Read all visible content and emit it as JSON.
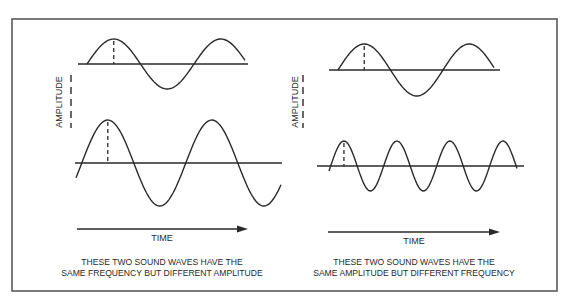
{
  "figure": {
    "frame": {
      "x": 12,
      "y": 19,
      "width": 545,
      "height": 272,
      "stroke": "#5a5a5a"
    },
    "ink_color": "#2a2a2a",
    "panels": [
      {
        "id": "left",
        "amplitude_label": "AMPLITUDE",
        "time_label": "TIME",
        "caption_line1": "THESE TWO SOUND WAVES HAVE THE",
        "caption_line2": "SAME FREQUENCY BUT DIFFERENT AMPLITUDE",
        "waves": [
          {
            "name": "top-left-wave",
            "axis_x1": 78,
            "axis_x2": 248,
            "baseline_y": 64,
            "start_x": 87,
            "end_x": 245,
            "amplitude": 25,
            "period": 107,
            "phase_start": 0,
            "peak_marker_x": 113
          },
          {
            "name": "bottom-left-wave",
            "axis_x1": 75,
            "axis_x2": 282,
            "baseline_y": 163,
            "start_x": 76,
            "end_x": 281,
            "amplitude": 43,
            "period": 104,
            "phase_start": -0.35,
            "peak_marker_x": 102
          }
        ],
        "amp_label_x": 59,
        "amp_label_y": 102,
        "amp_dash_x": 71,
        "amp_dash_y1": 75,
        "amp_dash_y2": 128,
        "arrow": {
          "x1": 77,
          "x2": 248,
          "y": 229
        },
        "time_x": 162,
        "time_y": 241,
        "caption_x": 162,
        "caption_y1": 265,
        "caption_y2": 276
      },
      {
        "id": "right",
        "amplitude_label": "AMPLITUDE",
        "time_label": "TIME",
        "caption_line1": "THESE TWO SOUND WAVES HAVE THE",
        "caption_line2": "SAME AMPLITUDE BUT DIFFERENT FREQUENCY",
        "waves": [
          {
            "name": "top-right-wave",
            "axis_x1": 329,
            "axis_x2": 500,
            "baseline_y": 70,
            "start_x": 338,
            "end_x": 494,
            "amplitude": 26,
            "period": 105,
            "phase_start": 0,
            "peak_marker_x": 363
          },
          {
            "name": "bottom-right-wave",
            "axis_x1": 317,
            "axis_x2": 524,
            "baseline_y": 166,
            "start_x": 329,
            "end_x": 517,
            "amplitude": 25,
            "period": 53,
            "phase_start": -0.2,
            "peak_marker_x": 343
          }
        ],
        "amp_label_x": 295,
        "amp_label_y": 102,
        "amp_dash_x": 303,
        "amp_dash_y1": 75,
        "amp_dash_y2": 128,
        "arrow": {
          "x1": 328,
          "x2": 500,
          "y": 232
        },
        "time_x": 414,
        "time_y": 244,
        "caption_x": 414,
        "caption_y1": 265,
        "caption_y2": 276
      }
    ]
  }
}
